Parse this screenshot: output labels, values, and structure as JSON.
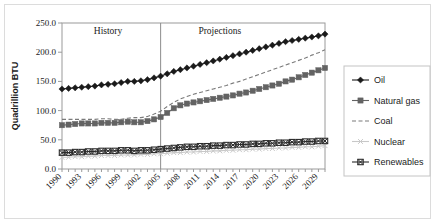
{
  "chart_data": {
    "type": "line",
    "title": "",
    "xlabel": "",
    "ylabel": "Quadrillion BTU",
    "ylim": [
      0,
      250
    ],
    "ytick_labels": [
      "0.0",
      "50.0",
      "100.0",
      "150.0",
      "200.0",
      "250.0"
    ],
    "ytick_values": [
      0,
      50,
      100,
      150,
      200,
      250
    ],
    "grid": false,
    "legend_position": "right",
    "x": [
      1990,
      1991,
      1992,
      1993,
      1994,
      1995,
      1996,
      1997,
      1998,
      1999,
      2000,
      2001,
      2002,
      2003,
      2004,
      2005,
      2006,
      2007,
      2008,
      2009,
      2010,
      2011,
      2012,
      2013,
      2014,
      2015,
      2016,
      2017,
      2018,
      2019,
      2020,
      2021,
      2022,
      2023,
      2024,
      2025,
      2026,
      2027,
      2028,
      2029,
      2030
    ],
    "xtick_labels": [
      "1990",
      "1993",
      "1996",
      "1999",
      "2002",
      "2005",
      "2008",
      "2011",
      "2014",
      "2017",
      "2020",
      "2023",
      "2026",
      "2029"
    ],
    "xtick_values": [
      1990,
      1993,
      1996,
      1999,
      2002,
      2005,
      2008,
      2011,
      2014,
      2017,
      2020,
      2023,
      2026,
      2029
    ],
    "annotations": [
      {
        "label": "History",
        "x": 1997,
        "y": 232
      },
      {
        "label": "Projections",
        "x": 2014,
        "y": 232
      }
    ],
    "divider_x": 2005,
    "series": [
      {
        "name": "Oil",
        "marker": "diamond",
        "color": "#1a1a1a",
        "style": "solid",
        "values": [
          137,
          138,
          139,
          140,
          141,
          142,
          144,
          145,
          146,
          148,
          150,
          150,
          151,
          153,
          156,
          159,
          163,
          167,
          170,
          173,
          176,
          179,
          182,
          185,
          188,
          191,
          194,
          197,
          200,
          203,
          206,
          209,
          212,
          215,
          218,
          220,
          222,
          224,
          226,
          228,
          231
        ]
      },
      {
        "name": "Natural gas",
        "marker": "square",
        "color": "#636363",
        "style": "solid",
        "values": [
          75,
          76,
          77,
          78,
          78,
          78,
          79,
          79,
          79,
          80,
          81,
          80,
          80,
          82,
          85,
          89,
          96,
          104,
          109,
          112,
          114,
          116,
          118,
          120,
          122,
          124,
          126,
          129,
          131,
          134,
          137,
          140,
          143,
          146,
          150,
          153,
          157,
          161,
          165,
          169,
          173
        ]
      },
      {
        "name": "Coal",
        "marker": "none",
        "color": "#7a7a7a",
        "style": "dashed",
        "values": [
          85,
          85,
          85,
          85,
          85,
          85,
          86,
          86,
          85,
          85,
          87,
          88,
          88,
          90,
          94,
          99,
          107,
          114,
          120,
          124,
          128,
          131,
          134,
          137,
          140,
          143,
          147,
          150,
          154,
          158,
          162,
          166,
          170,
          174,
          178,
          182,
          186,
          190,
          195,
          199,
          204
        ]
      },
      {
        "name": "Nuclear",
        "marker": "x",
        "color": "#c8c8c8",
        "style": "solid",
        "values": [
          20,
          20,
          21,
          21,
          22,
          22,
          23,
          23,
          23,
          24,
          24,
          24,
          25,
          25,
          26,
          26,
          27,
          28,
          28,
          29,
          29,
          30,
          30,
          31,
          31,
          32,
          32,
          33,
          33,
          34,
          34,
          35,
          35,
          36,
          36,
          37,
          37,
          38,
          38,
          39,
          40
        ]
      },
      {
        "name": "Renewables",
        "marker": "x-square",
        "color": "#2b2b2b",
        "style": "solid",
        "values": [
          28,
          28,
          29,
          29,
          30,
          30,
          31,
          31,
          31,
          32,
          32,
          31,
          32,
          32,
          33,
          34,
          35,
          36,
          37,
          38,
          38,
          39,
          39,
          40,
          40,
          41,
          41,
          42,
          42,
          43,
          43,
          44,
          44,
          45,
          45,
          46,
          46,
          47,
          47,
          48,
          48
        ]
      }
    ]
  },
  "legend": {
    "items": [
      {
        "label": "Oil"
      },
      {
        "label": "Natural gas"
      },
      {
        "label": "Coal"
      },
      {
        "label": "Nuclear"
      },
      {
        "label": "Renewables"
      }
    ]
  }
}
